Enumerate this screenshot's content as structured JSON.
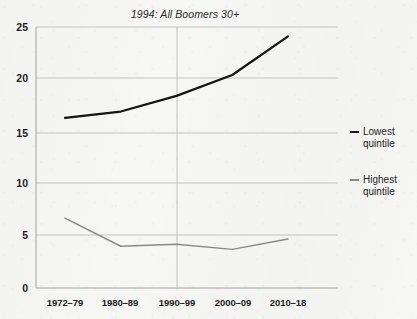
{
  "chart_data": {
    "type": "line",
    "title": "1994: All Boomers 30+",
    "xlabel": "",
    "ylabel": "",
    "categories": [
      "1972–79",
      "1980–89",
      "1990–99",
      "2000–09",
      "2010–18"
    ],
    "ylim": [
      0,
      25
    ],
    "yticks": [
      0,
      5,
      10,
      15,
      20,
      25
    ],
    "grid": "horizontal",
    "legend_position": "right",
    "series": [
      {
        "name": "Lowest quintile",
        "legend_label": "Lowest\nquintile",
        "color": "#141414",
        "values": [
          16.3,
          16.9,
          18.4,
          20.4,
          24.1
        ]
      },
      {
        "name": "Highest quintile",
        "legend_label": "Highest\nquintile",
        "color": "#8a8a8a",
        "values": [
          6.7,
          4.0,
          4.2,
          3.7,
          4.7
        ]
      }
    ]
  },
  "axis": {
    "y_tick_labels": [
      "25",
      "20",
      "15",
      "10",
      "5",
      "0"
    ],
    "x_tick_labels": [
      "1972–79",
      "1980–89",
      "1990–99",
      "2000–09",
      "2010–18"
    ]
  },
  "legend": {
    "items": [
      {
        "label_line1": "Lowest",
        "label_line2": "quintile",
        "color": "#141414"
      },
      {
        "label_line1": "Highest",
        "label_line2": "quintile",
        "color": "#8a8a8a"
      }
    ]
  },
  "colors": {
    "background": "#f6f6f4",
    "axis": "#9a9a9a",
    "grid": "#b9b9b9",
    "text": "#1c1c1c"
  }
}
